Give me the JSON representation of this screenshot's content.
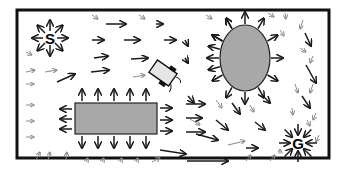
{
  "diagram": {
    "labels": {
      "start": "S",
      "goal": "G"
    },
    "colors": {
      "border": "#111111",
      "obstacle_fill": "#a8a8a8",
      "robot_fill": "#e6e6e6",
      "arrow_dark": "#1a1a1a",
      "arrow_light": "#8a8a8a",
      "background": "#ffffff"
    },
    "border": {
      "x": 17,
      "y": 10,
      "w": 312,
      "h": 148
    },
    "start": {
      "x": 50,
      "y": 38
    },
    "goal": {
      "x": 298,
      "y": 143
    },
    "ellipse_obstacle": {
      "cx": 245,
      "cy": 58,
      "rx": 25,
      "ry": 33
    },
    "rect_obstacle": {
      "x": 75,
      "y": 103,
      "w": 82,
      "h": 31
    },
    "robot": {
      "cx": 163,
      "cy": 73,
      "w": 24,
      "h": 15,
      "angle": 35
    },
    "arrows": [
      [
        92,
        15,
        98,
        19,
        0
      ],
      [
        106,
        24,
        126,
        24,
        1
      ],
      [
        139,
        15,
        145,
        19,
        0
      ],
      [
        156,
        24,
        163,
        24,
        1
      ],
      [
        206,
        15,
        212,
        19,
        0
      ],
      [
        92,
        40,
        104,
        40,
        1
      ],
      [
        124,
        40,
        140,
        40,
        1
      ],
      [
        164,
        40,
        176,
        40,
        1
      ],
      [
        26,
        52,
        32,
        55,
        0
      ],
      [
        94,
        58,
        108,
        56,
        1
      ],
      [
        131,
        59,
        148,
        58,
        1
      ],
      [
        185,
        40,
        188,
        46,
        1
      ],
      [
        185,
        58,
        188,
        63,
        1
      ],
      [
        26,
        72,
        35,
        70,
        0
      ],
      [
        45,
        72,
        57,
        70,
        0
      ],
      [
        57,
        82,
        75,
        74,
        1
      ],
      [
        91,
        72,
        109,
        70,
        1
      ],
      [
        133,
        77,
        145,
        75,
        0
      ],
      [
        26,
        84,
        34,
        84,
        0
      ],
      [
        48,
        88,
        48,
        88,
        1
      ],
      [
        26,
        105,
        34,
        105,
        0
      ],
      [
        26,
        121,
        34,
        121,
        0
      ],
      [
        26,
        137,
        34,
        137,
        0
      ],
      [
        36,
        160,
        40,
        152,
        0
      ],
      [
        48,
        160,
        50,
        152,
        0
      ],
      [
        66,
        160,
        67,
        152,
        0
      ],
      [
        86,
        162,
        88,
        158,
        0
      ],
      [
        102,
        162,
        104,
        158,
        0
      ],
      [
        120,
        162,
        122,
        158,
        0
      ],
      [
        136,
        162,
        138,
        158,
        0
      ],
      [
        152,
        162,
        160,
        158,
        0
      ],
      [
        160,
        150,
        186,
        154,
        1
      ],
      [
        187,
        161,
        228,
        161,
        1
      ],
      [
        246,
        161,
        251,
        155,
        0
      ],
      [
        270,
        161,
        275,
        155,
        0
      ],
      [
        186,
        104,
        205,
        104,
        1
      ],
      [
        186,
        118,
        202,
        118,
        1
      ],
      [
        186,
        132,
        205,
        132,
        1
      ],
      [
        188,
        96,
        194,
        103,
        1
      ],
      [
        216,
        100,
        222,
        108,
        0
      ],
      [
        232,
        103,
        240,
        114,
        1
      ],
      [
        190,
        119,
        200,
        125,
        0
      ],
      [
        216,
        120,
        228,
        130,
        1
      ],
      [
        196,
        134,
        218,
        140,
        1
      ],
      [
        228,
        145,
        245,
        141,
        0
      ],
      [
        246,
        148,
        258,
        148,
        1
      ],
      [
        255,
        122,
        265,
        130,
        1
      ],
      [
        250,
        105,
        254,
        112,
        0
      ],
      [
        262,
        95,
        270,
        103,
        1
      ],
      [
        268,
        13,
        274,
        17,
        0
      ],
      [
        285,
        13,
        286,
        19,
        0
      ],
      [
        280,
        30,
        284,
        36,
        0
      ],
      [
        303,
        20,
        300,
        29,
        0
      ],
      [
        305,
        33,
        311,
        46,
        1
      ],
      [
        300,
        48,
        306,
        52,
        0
      ],
      [
        313,
        56,
        310,
        63,
        0
      ],
      [
        306,
        65,
        316,
        83,
        1
      ],
      [
        313,
        84,
        310,
        93,
        0
      ],
      [
        295,
        84,
        298,
        93,
        0
      ],
      [
        302,
        96,
        310,
        108,
        1
      ],
      [
        292,
        108,
        293,
        115,
        0
      ],
      [
        316,
        113,
        313,
        120,
        0
      ],
      [
        307,
        120,
        310,
        126,
        0
      ],
      [
        319,
        135,
        316,
        142,
        0
      ],
      [
        280,
        154,
        280,
        149,
        0
      ]
    ],
    "rect_arrows_up": [
      82,
      98,
      114,
      130,
      146
    ],
    "rect_arrows_down": [
      82,
      98,
      114,
      130,
      146
    ],
    "rect_arrows_left": [
      109,
      119,
      129
    ],
    "rect_arrows_right": [
      108,
      120,
      131
    ]
  }
}
